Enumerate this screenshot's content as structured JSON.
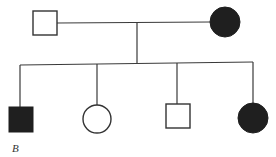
{
  "diagram": {
    "type": "pedigree",
    "panel_label": "B",
    "colors": {
      "affected": "#1f1f1f",
      "unaffected_fill": "#ffffff",
      "line": "#3a3a3a"
    },
    "parents": [
      {
        "id": "father",
        "sex": "male",
        "shape": "square",
        "affected": false
      },
      {
        "id": "mother",
        "sex": "female",
        "shape": "circle",
        "affected": true
      }
    ],
    "children": [
      {
        "id": "child-1",
        "sex": "male",
        "shape": "square",
        "affected": true
      },
      {
        "id": "child-2",
        "sex": "female",
        "shape": "circle",
        "affected": false
      },
      {
        "id": "child-3",
        "sex": "male",
        "shape": "square",
        "affected": false
      },
      {
        "id": "child-4",
        "sex": "female",
        "shape": "circle",
        "affected": true
      }
    ]
  }
}
